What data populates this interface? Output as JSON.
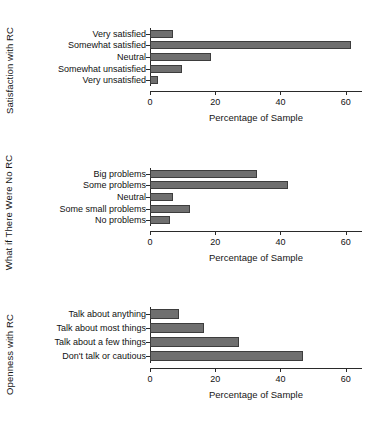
{
  "figure": {
    "shared_xlabel": "Percentage of Sample",
    "bar_color": "#6f6f6f",
    "bar_edge_color": "#3d3d3d",
    "axis_color": "#2a2a2a",
    "background": "#ffffff"
  },
  "chart_data": [
    {
      "type": "bar",
      "orientation": "horizontal",
      "title": "",
      "ylabel": "Satisfaction with RC",
      "xlabel": "Percentage of Sample",
      "categories": [
        "Very satisfied",
        "Somewhat satisfied",
        "Neutral",
        "Somewhat unsatisfied",
        "Very unsatisfied"
      ],
      "values": [
        7.2,
        61.5,
        18.8,
        9.7,
        2.3
      ],
      "xlim": [
        0,
        65
      ],
      "xticks": [
        0,
        20,
        40,
        60
      ],
      "xticklabels": [
        "0",
        "20",
        "40",
        "60"
      ],
      "grid": false,
      "legend": "none"
    },
    {
      "type": "bar",
      "orientation": "horizontal",
      "title": "",
      "ylabel": "What if There Were No RC",
      "xlabel": "Percentage of Sample",
      "categories": [
        "Big problems",
        "Some problems",
        "Neutral",
        "Some small problems",
        "No problems"
      ],
      "values": [
        32.8,
        42.4,
        7.0,
        12.4,
        6.0
      ],
      "xlim": [
        0,
        65
      ],
      "xticks": [
        0,
        20,
        40,
        60
      ],
      "xticklabels": [
        "0",
        "20",
        "40",
        "60"
      ],
      "grid": false,
      "legend": "none"
    },
    {
      "type": "bar",
      "orientation": "horizontal",
      "title": "",
      "ylabel": "Openness with RC",
      "xlabel": "Percentage of Sample",
      "categories": [
        "Talk about anything",
        "Talk about most things",
        "Talk about a few things",
        "Don't talk or cautious"
      ],
      "values": [
        9.0,
        16.5,
        27.4,
        47.0
      ],
      "xlim": [
        0,
        65
      ],
      "xticks": [
        0,
        20,
        40,
        60
      ],
      "xticklabels": [
        "0",
        "20",
        "40",
        "60"
      ],
      "grid": false,
      "legend": "none"
    }
  ]
}
